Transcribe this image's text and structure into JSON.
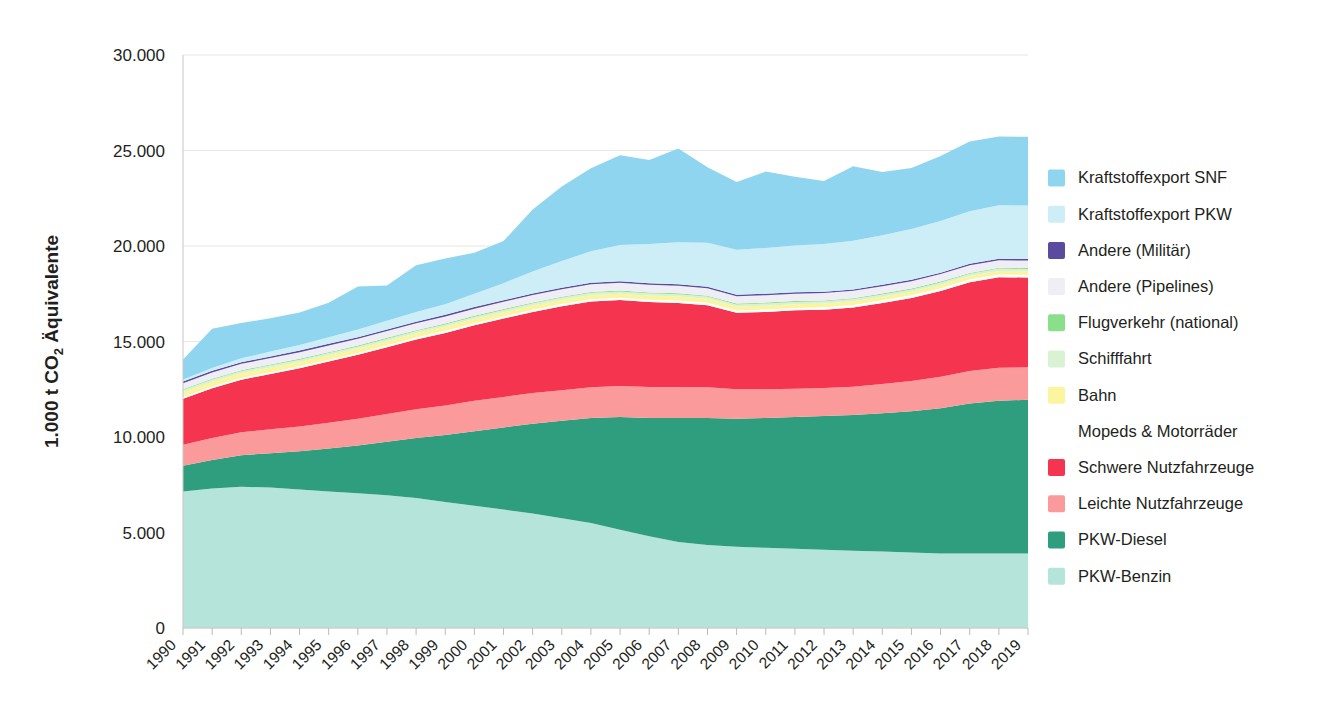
{
  "chart_data": {
    "type": "area",
    "stacked": true,
    "title": "",
    "xlabel": "",
    "ylabel": "1.000 t CO2 Äquivalente",
    "ylabel_parts": {
      "pre": "1.000 t CO",
      "sub": "2",
      "post": " Äquivalente"
    },
    "ylim": [
      0,
      30000
    ],
    "yticks": [
      0,
      5000,
      10000,
      15000,
      20000,
      25000,
      30000
    ],
    "ytick_labels": [
      "0",
      "5.000",
      "10.000",
      "15.000",
      "20.000",
      "25.000",
      "30.000"
    ],
    "grid": true,
    "legend_position": "right",
    "categories": [
      "1990",
      "1991",
      "1992",
      "1993",
      "1994",
      "1995",
      "1996",
      "1997",
      "1998",
      "1999",
      "2000",
      "2001",
      "2002",
      "2003",
      "2004",
      "2005",
      "2006",
      "2007",
      "2008",
      "2009",
      "2010",
      "2011",
      "2012",
      "2013",
      "2014",
      "2015",
      "2016",
      "2017",
      "2018",
      "2019"
    ],
    "series": [
      {
        "name": "PKW-Benzin",
        "color": "#b5e5da",
        "values": [
          7150,
          7300,
          7400,
          7350,
          7250,
          7150,
          7050,
          6950,
          6800,
          6600,
          6400,
          6200,
          6000,
          5750,
          5500,
          5150,
          4800,
          4500,
          4350,
          4250,
          4200,
          4150,
          4100,
          4050,
          4000,
          3950,
          3900,
          3900,
          3900,
          3900
        ]
      },
      {
        "name": "PKW-Diesel",
        "color": "#2e9e7e",
        "values": [
          1350,
          1500,
          1650,
          1800,
          2000,
          2250,
          2500,
          2800,
          3150,
          3500,
          3900,
          4300,
          4700,
          5100,
          5500,
          5900,
          6200,
          6500,
          6650,
          6700,
          6800,
          6900,
          7000,
          7100,
          7250,
          7400,
          7600,
          7850,
          8000,
          8050
        ]
      },
      {
        "name": "Leichte Nutzfahrzeuge",
        "color": "#f99",
        "color_hex": "#fb9a9a",
        "values": [
          1100,
          1150,
          1200,
          1250,
          1300,
          1350,
          1400,
          1450,
          1500,
          1550,
          1600,
          1600,
          1600,
          1600,
          1600,
          1620,
          1620,
          1620,
          1600,
          1550,
          1500,
          1480,
          1460,
          1480,
          1520,
          1580,
          1650,
          1700,
          1720,
          1700
        ]
      },
      {
        "name": "Schwere Nutzfahrzeuge",
        "color": "#f5344f",
        "values": [
          2400,
          2600,
          2750,
          2900,
          3050,
          3200,
          3350,
          3500,
          3650,
          3800,
          3950,
          4100,
          4250,
          4400,
          4500,
          4500,
          4450,
          4400,
          4300,
          4000,
          4050,
          4100,
          4100,
          4150,
          4250,
          4350,
          4500,
          4650,
          4750,
          4700
        ]
      },
      {
        "name": "Mopeds & Motorräder",
        "color": "#ffffff",
        "values": [
          90,
          92,
          94,
          96,
          98,
          100,
          102,
          104,
          106,
          108,
          110,
          112,
          114,
          116,
          118,
          120,
          122,
          124,
          126,
          126,
          128,
          130,
          130,
          132,
          134,
          136,
          138,
          140,
          142,
          142
        ]
      },
      {
        "name": "Bahn",
        "color": "#fbf5a0",
        "values": [
          260,
          255,
          250,
          245,
          240,
          235,
          230,
          228,
          226,
          224,
          222,
          220,
          218,
          216,
          214,
          212,
          210,
          208,
          206,
          200,
          198,
          196,
          194,
          192,
          190,
          188,
          186,
          184,
          182,
          180
        ]
      },
      {
        "name": "Schifffahrt",
        "color": "#d9f2d3",
        "values": [
          110,
          110,
          110,
          110,
          110,
          112,
          112,
          112,
          112,
          114,
          114,
          114,
          116,
          116,
          116,
          118,
          118,
          118,
          118,
          116,
          116,
          116,
          118,
          118,
          118,
          120,
          120,
          120,
          122,
          122
        ]
      },
      {
        "name": "Flugverkehr (national)",
        "color": "#8ae08a",
        "values": [
          40,
          40,
          42,
          42,
          44,
          44,
          46,
          46,
          48,
          48,
          50,
          50,
          50,
          50,
          50,
          50,
          50,
          50,
          48,
          46,
          46,
          46,
          46,
          46,
          46,
          46,
          46,
          48,
          48,
          48
        ]
      },
      {
        "name": "Andere (Pipelines)",
        "color": "#f0eef5",
        "values": [
          320,
          330,
          335,
          340,
          345,
          350,
          355,
          360,
          365,
          370,
          375,
          380,
          385,
          390,
          395,
          400,
          400,
          400,
          395,
          385,
          385,
          385,
          385,
          385,
          385,
          390,
          390,
          395,
          395,
          395
        ]
      },
      {
        "name": "Andere (Militär)",
        "color": "#5b4b9e",
        "values": [
          90,
          90,
          88,
          88,
          86,
          86,
          84,
          84,
          82,
          82,
          80,
          80,
          80,
          80,
          80,
          80,
          80,
          80,
          78,
          76,
          76,
          76,
          76,
          76,
          76,
          76,
          76,
          78,
          78,
          78
        ]
      },
      {
        "name": "Kraftstoffexport PKW",
        "color": "#cdeef7",
        "values": [
          100,
          150,
          200,
          250,
          300,
          350,
          400,
          450,
          500,
          550,
          700,
          900,
          1150,
          1400,
          1650,
          1900,
          2050,
          2200,
          2300,
          2350,
          2400,
          2450,
          2500,
          2550,
          2600,
          2650,
          2700,
          2750,
          2800,
          2800
        ]
      },
      {
        "name": "Kraftstoffexport SNF",
        "color": "#8fd5ef",
        "values": [
          1050,
          2050,
          1850,
          1750,
          1700,
          1800,
          2250,
          1850,
          2450,
          2400,
          2150,
          2200,
          3250,
          3900,
          4350,
          4700,
          4400,
          4900,
          3950,
          3550,
          4000,
          3600,
          3300,
          3900,
          3300,
          3200,
          3400,
          3650,
          3600,
          3600
        ]
      }
    ]
  },
  "legend": {
    "items": [
      {
        "label": "Kraftstoffexport SNF",
        "color": "#8fd5ef"
      },
      {
        "label": "Kraftstoffexport PKW",
        "color": "#cdeef7"
      },
      {
        "label": "Andere (Militär)",
        "color": "#5b4b9e"
      },
      {
        "label": "Andere (Pipelines)",
        "color": "#f0eef5"
      },
      {
        "label": "Flugverkehr (national)",
        "color": "#8ae08a"
      },
      {
        "label": "Schifffahrt",
        "color": "#d9f2d3"
      },
      {
        "label": "Bahn",
        "color": "#fbf5a0"
      },
      {
        "label": "Mopeds & Motorräder",
        "color": "#ffffff"
      },
      {
        "label": "Schwere Nutzfahrzeuge",
        "color": "#f5344f"
      },
      {
        "label": "Leichte Nutzfahrzeuge",
        "color": "#fb9a9a"
      },
      {
        "label": "PKW-Diesel",
        "color": "#2e9e7e"
      },
      {
        "label": "PKW-Benzin",
        "color": "#b5e5da"
      }
    ]
  }
}
